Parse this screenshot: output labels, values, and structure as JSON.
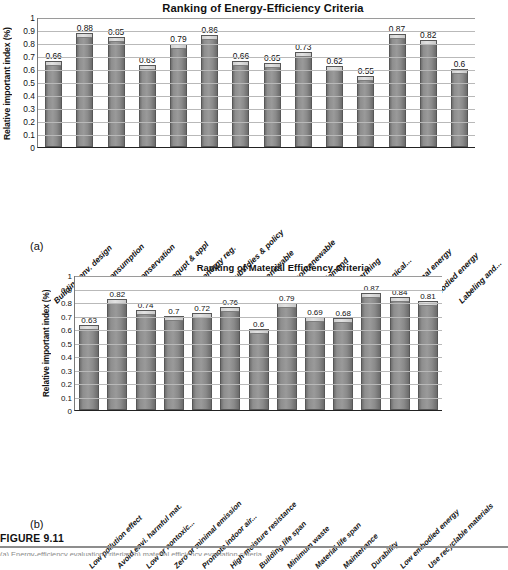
{
  "figure": {
    "number_label": "FIGURE 9.11",
    "caption_text": "(a) Energy-efficiency evaluation criteria; (b) material efficiency evaluation criteria.",
    "panel_a_label": "(a)",
    "panel_b_label": "(b)"
  },
  "chart_data": [
    {
      "id": "chart-a",
      "type": "bar",
      "title": "Ranking of Energy-Efficiency Criteria",
      "xlabel": "",
      "ylabel": "Relative important index (%)",
      "ylim": [
        0,
        1
      ],
      "ytick_labels": [
        "1",
        "0.9",
        "0.8",
        "0.7",
        "0.6",
        "0.5",
        "0.4",
        "0.3",
        "0.2",
        "0.1",
        "0"
      ],
      "yticks": [
        1,
        0.9,
        0.8,
        0.7,
        0.6,
        0.5,
        0.4,
        0.3,
        0.2,
        0.1,
        0
      ],
      "grid": true,
      "legend": "none",
      "bar_color": "#8f8f8f",
      "categories": [
        "Building env. design",
        "Energy consumption",
        "Energy conservation",
        "Building equpt & appl",
        "Building energy reg.",
        "Energy subsidies & policy",
        "Depl. of renewable",
        "Depl. of nonrenewable",
        "Energy demand",
        "Global warming",
        "Technological...",
        "Operational energy",
        "Embodied energy",
        "Labeling and..."
      ],
      "values": [
        0.66,
        0.88,
        0.85,
        0.63,
        0.79,
        0.86,
        0.66,
        0.65,
        0.73,
        0.62,
        0.55,
        0.87,
        0.82,
        0.6
      ],
      "value_labels": [
        "0.66",
        "0.88",
        "0.85",
        "0.63",
        "0.79",
        "0.86",
        "0.66",
        "0.65",
        "0.73",
        "0.62",
        "0.55",
        "0.87",
        "0.82",
        "0.6"
      ]
    },
    {
      "id": "chart-b",
      "type": "bar",
      "title": "Ranking of Material Efficiency Criteria",
      "xlabel": "",
      "ylabel": "Relative important index (%)",
      "ylim": [
        0,
        1
      ],
      "ytick_labels": [
        "1",
        "0.9",
        "0.8",
        "0.7",
        "0.6",
        "0.5",
        "0.4",
        "0.3",
        "0.2",
        "0.1",
        "0"
      ],
      "yticks": [
        1,
        0.9,
        0.8,
        0.7,
        0.6,
        0.5,
        0.4,
        0.3,
        0.2,
        0.1,
        0
      ],
      "grid": true,
      "legend": "none",
      "bar_color": "#8f8f8f",
      "categories": [
        "Low pollution effect",
        "Avoid envi. harmful mat.",
        "Low or nontoxic...",
        "Zero or minimal emission",
        "Promote indoor air...",
        "High moisture resistance",
        "Building life span",
        "Minimum waste",
        "Material life span",
        "Maintenance",
        "Durability",
        "Low embodied energy",
        "Use recyclable materials"
      ],
      "values": [
        0.63,
        0.82,
        0.74,
        0.7,
        0.72,
        0.76,
        0.6,
        0.79,
        0.69,
        0.68,
        0.87,
        0.84,
        0.81
      ],
      "value_labels": [
        "0.63",
        "0.82",
        "0.74",
        "0.7",
        "0.72",
        "0.76",
        "0.6",
        "0.79",
        "0.69",
        "0.68",
        "0.87",
        "0.84",
        "0.81"
      ]
    }
  ]
}
